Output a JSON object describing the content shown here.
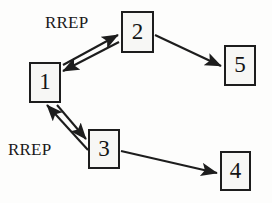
{
  "diagram": {
    "background_color": "#fdfdfc",
    "stroke_color": "#1d1d1d",
    "node_fill_color": "#f7f7f5",
    "nodes": [
      {
        "id": "1",
        "label": "1",
        "x": 29,
        "y": 62,
        "w": 32,
        "h": 41
      },
      {
        "id": "2",
        "label": "2",
        "x": 121,
        "y": 11,
        "w": 33,
        "h": 42
      },
      {
        "id": "3",
        "label": "3",
        "x": 88,
        "y": 129,
        "w": 32,
        "h": 40
      },
      {
        "id": "4",
        "label": "4",
        "x": 220,
        "y": 151,
        "w": 31,
        "h": 40
      },
      {
        "id": "5",
        "label": "5",
        "x": 224,
        "y": 45,
        "w": 32,
        "h": 41
      }
    ],
    "edges": [
      {
        "id": "edge-1-to-2",
        "from": "1",
        "to": "2",
        "direction": "forward",
        "x1": 63,
        "y1": 65,
        "x2": 118,
        "y2": 35
      },
      {
        "id": "edge-2-to-1",
        "from": "2",
        "to": "1",
        "direction": "forward",
        "x1": 119,
        "y1": 42,
        "x2": 63,
        "y2": 71
      },
      {
        "id": "edge-2-to-5",
        "from": "2",
        "to": "5",
        "direction": "forward",
        "x1": 155,
        "y1": 35,
        "x2": 221,
        "y2": 66
      },
      {
        "id": "edge-1-to-3",
        "from": "1",
        "to": "3",
        "direction": "forward",
        "x1": 57,
        "y1": 105,
        "x2": 86,
        "y2": 139
      },
      {
        "id": "edge-3-to-1",
        "from": "3",
        "to": "1",
        "direction": "forward",
        "x1": 88,
        "y1": 150,
        "x2": 47,
        "y2": 105
      },
      {
        "id": "edge-3-to-4",
        "from": "3",
        "to": "4",
        "direction": "forward",
        "x1": 121,
        "y1": 151,
        "x2": 217,
        "y2": 173
      }
    ],
    "labels": [
      {
        "id": "rrep-top",
        "text": "RREP",
        "x": 45,
        "y": 13
      },
      {
        "id": "rrep-bottom",
        "text": "RREP",
        "x": 8,
        "y": 140
      }
    ]
  }
}
